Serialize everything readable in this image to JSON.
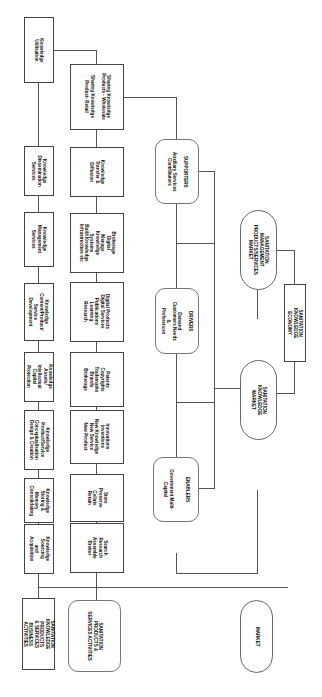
{
  "diagram": {
    "top_row": [
      {
        "id": "utilization",
        "label": "Knowledge Utilisation"
      },
      {
        "id": "dissemination",
        "label": "Knowledge\nDissemination\nServices"
      },
      {
        "id": "management",
        "label": "Knowledge\nManagement\nServices"
      },
      {
        "id": "content",
        "label": "Knowledge\nContent/Product/\nService\nDevelopment"
      },
      {
        "id": "assets",
        "label": "Knowledge\nAssets/\nIntellectual\nCapital\nProtection"
      },
      {
        "id": "conceptualisation",
        "label": "Knowledge\nProduct/Service\nConceptualisation\nDesign & Creation"
      },
      {
        "id": "storing",
        "label": "Knowledge\nStoring &\nMemory\nConsolidating"
      },
      {
        "id": "sourcing",
        "label": "Knowledge\nSourcing and\nAcquisition"
      },
      {
        "id": "root",
        "label": "SANITATION\nKNOWLEDGE PRODUCTS\n& SERVICES BUSINESS\nACTIVITIES"
      }
    ],
    "second_row": [
      {
        "id": "sharing",
        "label": "Sharing Knowledge\nProducts - Wholesale\n\nSharing Knowledge\nProduct- Retail"
      },
      {
        "id": "transfer",
        "label": "Knowledge\nTransfer &\nDiffusion"
      },
      {
        "id": "brokerage",
        "label": "Brokerage\nDigital\nManage\nKnowledge\nSystems\nBuild Knowledge\nInfrastructure etc"
      },
      {
        "id": "digital",
        "label": "Digital Products\nDigital Services\nPublications\nLearning\nResearch"
      },
      {
        "id": "patents",
        "label": "Patents\nCopyrights\nTrademarks\nBrands\nBrokerage"
      },
      {
        "id": "innovations",
        "label": "Innovations\nInventions\nNew Knowledge\nNew Service\nNew Product"
      },
      {
        "id": "store",
        "label": "Store\nPreserve\nCollate\nRetain"
      },
      {
        "id": "search",
        "label": "Search\nResearch\nAssemble\nBroker"
      },
      {
        "id": "sanitation_products",
        "label": "SANITATION PRODUCTS &\nSERVICES ACTIVITIES"
      }
    ],
    "factors": [
      {
        "id": "supporters",
        "title": "SUPPORTERS",
        "label": "SUPPORTERS\n\nAuxiliary Services\nContributors"
      },
      {
        "id": "drivers",
        "title": "DRIVERS",
        "label": "DRIVERS\n\nDemand\nCustomers Needs &\nPreferences"
      },
      {
        "id": "enablers",
        "title": "ENABLERS",
        "label": "ENABLERS\n\n\nGovernment Multi-Capital"
      }
    ],
    "markets": [
      {
        "id": "mgmt_market",
        "label": "SANITATION MANAGEMENT\nPRODUCTS/SERVICES\nMARKET"
      },
      {
        "id": "economy",
        "label": "SANITATION KNOWLEDGE\nECONOMY"
      },
      {
        "id": "knowledge_market",
        "label": "SANITATION KNOWLEDGE\nMARKET"
      },
      {
        "id": "market",
        "label": "MARKET"
      }
    ]
  }
}
